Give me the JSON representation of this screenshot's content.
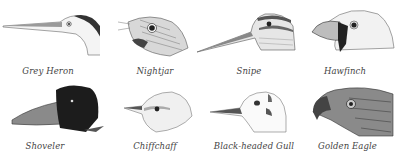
{
  "figure": {
    "row1": [
      {
        "id": "grey-heron",
        "caption": "Grey Heron"
      },
      {
        "id": "nightjar",
        "caption": "Nightjar"
      },
      {
        "id": "snipe",
        "caption": "Snipe"
      },
      {
        "id": "hawfinch",
        "caption": "Hawfinch"
      }
    ],
    "row2": [
      {
        "id": "shoveler",
        "caption": "Shoveler"
      },
      {
        "id": "chiffchaff",
        "caption": "Chiffchaff"
      },
      {
        "id": "black-headed-gull",
        "caption": "Black-headed Gull"
      },
      {
        "id": "golden-eagle",
        "caption": "Golden Eagle"
      }
    ]
  }
}
